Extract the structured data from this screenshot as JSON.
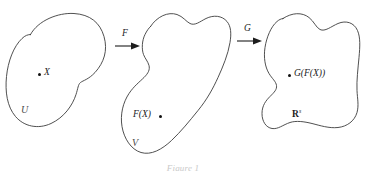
{
  "figure": {
    "caption": "Figure 1"
  },
  "domains": [
    {
      "id": "domain-u",
      "set_label": "U",
      "point_label": "X",
      "point_dot": "filled-dot"
    },
    {
      "id": "domain-v",
      "set_label": "V",
      "point_label": "F(X)",
      "point_dot": "filled-dot"
    },
    {
      "id": "domain-r",
      "set_label_base": "R",
      "set_label_superscript": "s",
      "point_label": "G(F(X))",
      "point_dot": "filled-dot"
    }
  ],
  "maps": [
    {
      "id": "map-f",
      "label": "F",
      "icon": "right-arrow-icon",
      "from": "U",
      "to": "V"
    },
    {
      "id": "map-g",
      "label": "G",
      "icon": "right-arrow-icon",
      "from": "V",
      "to": "R"
    }
  ],
  "colors": {
    "stroke": "#3c3c3c",
    "arrow": "#1d1d1d",
    "text": "#2a2a2a",
    "background": "#ffffff"
  }
}
